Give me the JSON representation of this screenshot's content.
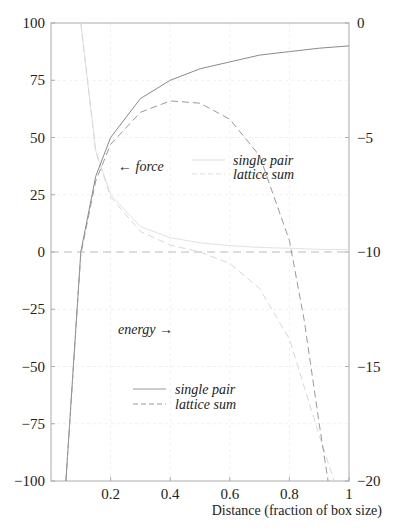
{
  "chart_data": [
    {
      "type": "line",
      "title": "",
      "xlabel": "Distance (fraction of box size)",
      "ylabel": "",
      "axis": "left",
      "quantity": "force",
      "annotation": "← force",
      "xlim": [
        0,
        1
      ],
      "ylim": [
        -100,
        100
      ],
      "x_ticks": [
        "0.2",
        "0.4",
        "0.6",
        "0.8",
        "1"
      ],
      "y_ticks": [
        "100",
        "75",
        "50",
        "25",
        "0",
        "−25",
        "−50",
        "−75",
        "−100"
      ],
      "grid": true,
      "legend": [
        "single pair",
        "lattice sum"
      ],
      "series": [
        {
          "name": "single pair",
          "style": "solid",
          "x": [
            0.1,
            0.15,
            0.2,
            0.3,
            0.4,
            0.5,
            0.6,
            0.7,
            0.8,
            0.9,
            1.0
          ],
          "values": [
            100,
            44.4,
            25,
            11.1,
            6.25,
            4,
            2.8,
            2.0,
            1.6,
            1.2,
            1.0
          ]
        },
        {
          "name": "lattice sum",
          "style": "dashed",
          "x": [
            0.1,
            0.15,
            0.2,
            0.3,
            0.4,
            0.5,
            0.6,
            0.7,
            0.8,
            0.9,
            0.95
          ],
          "values": [
            100,
            44,
            24,
            9,
            3,
            0,
            -5,
            -16,
            -38,
            -80,
            -100
          ]
        }
      ]
    },
    {
      "type": "line",
      "axis": "right",
      "quantity": "energy",
      "annotation": "energy →",
      "xlim": [
        0,
        1
      ],
      "ylim": [
        -20,
        0
      ],
      "y_ticks": [
        "0",
        "−5",
        "−10",
        "−15",
        "−20"
      ],
      "legend": [
        "single pair",
        "lattice sum"
      ],
      "series": [
        {
          "name": "single pair",
          "style": "solid",
          "x": [
            0.05,
            0.1,
            0.15,
            0.2,
            0.3,
            0.4,
            0.5,
            0.6,
            0.7,
            0.8,
            0.9,
            1.0
          ],
          "values": [
            -20,
            -10,
            -6.7,
            -5,
            -3.3,
            -2.5,
            -2.0,
            -1.7,
            -1.4,
            -1.25,
            -1.1,
            -1.0
          ]
        },
        {
          "name": "lattice sum",
          "style": "dashed",
          "x": [
            0.05,
            0.1,
            0.15,
            0.2,
            0.3,
            0.4,
            0.5,
            0.6,
            0.7,
            0.8,
            0.85,
            0.9,
            0.93
          ],
          "values": [
            -20,
            -10.1,
            -6.9,
            -5.3,
            -3.9,
            -3.4,
            -3.5,
            -4.2,
            -5.8,
            -9.5,
            -13,
            -17.5,
            -20
          ]
        }
      ]
    }
  ],
  "labels": {
    "force_annotation": "← force",
    "energy_annotation": "energy →",
    "force_legend_single": "single pair",
    "force_legend_lattice": "lattice sum",
    "energy_legend_single": "single pair",
    "energy_legend_lattice": "lattice sum",
    "xlabel": "Distance (fraction of box size)",
    "left_ticks": [
      "100",
      "75",
      "50",
      "25",
      "0",
      "−25",
      "−50",
      "−75",
      "−100"
    ],
    "right_ticks": [
      "0",
      "−5",
      "−10",
      "−15",
      "−20"
    ],
    "x_ticks": [
      "0.2",
      "0.4",
      "0.6",
      "0.8",
      "1"
    ]
  }
}
